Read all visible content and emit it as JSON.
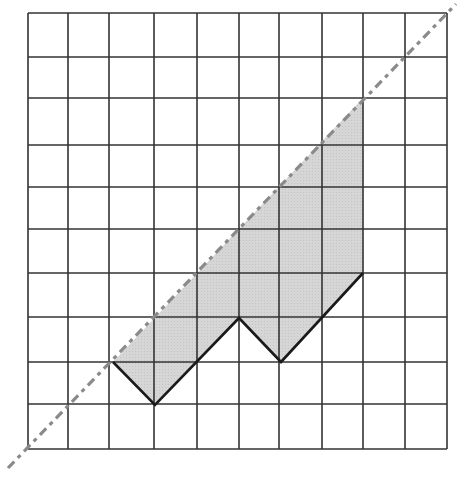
{
  "diagram": {
    "type": "grid-with-shaded-region",
    "grid": {
      "columns": 10,
      "rows": 10,
      "x_lines": [
        28,
        68,
        109,
        154,
        197,
        239,
        279,
        322,
        363,
        405,
        447
      ],
      "y_lines": [
        13,
        57,
        98,
        145,
        187,
        229,
        273,
        317,
        362,
        404,
        449
      ],
      "line_color": "#333333"
    },
    "diagonal": {
      "style": "dash-dot",
      "color": "#8a8a8a",
      "from": [
        8,
        468
      ],
      "to": [
        456,
        4
      ]
    },
    "shaded_region": {
      "fill": "#d4d4d4",
      "points": [
        [
          113,
          362
        ],
        [
          155,
          405
        ],
        [
          239,
          318
        ],
        [
          281,
          362
        ],
        [
          363,
          273
        ],
        [
          363,
          98
        ]
      ]
    },
    "boundary_path": {
      "color": "#1a1a1a",
      "points": [
        [
          113,
          362
        ],
        [
          155,
          405
        ],
        [
          239,
          318
        ],
        [
          281,
          362
        ],
        [
          363,
          273
        ]
      ]
    }
  }
}
